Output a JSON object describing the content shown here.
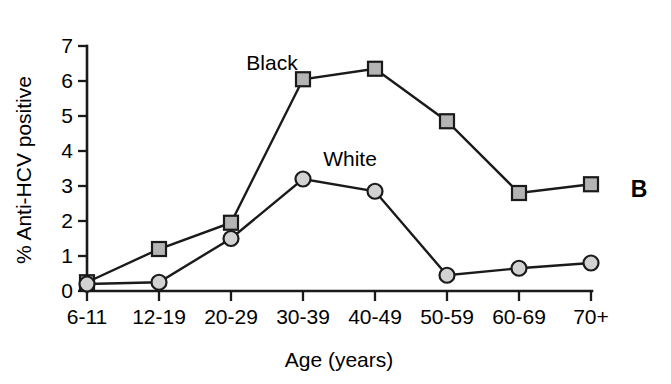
{
  "panel": {
    "label": "B"
  },
  "chart_data": {
    "type": "line",
    "title": "",
    "subtitle": "",
    "xlabel": "Age (years)",
    "ylabel": "% Anti-HCV positive",
    "categories": [
      "6-11",
      "12-19",
      "20-29",
      "30-39",
      "40-49",
      "50-59",
      "60-69",
      "70+"
    ],
    "series": [
      {
        "name": "Black",
        "marker": "square",
        "marker_fill": "#b4b4b4",
        "marker_edge": "#1a1a1a",
        "line_color": "#1a1a1a",
        "label_text": "Black",
        "values": [
          0.25,
          1.2,
          1.95,
          6.05,
          6.35,
          4.85,
          2.8,
          3.05
        ]
      },
      {
        "name": "White",
        "marker": "circle",
        "marker_fill": "#d2d2d2",
        "marker_edge": "#1a1a1a",
        "line_color": "#1a1a1a",
        "label_text": "White",
        "values": [
          0.2,
          0.25,
          1.5,
          3.2,
          2.85,
          0.45,
          0.65,
          0.8
        ]
      }
    ],
    "ylim": [
      0,
      7
    ],
    "yticks": [
      0,
      1,
      2,
      3,
      4,
      5,
      6,
      7
    ],
    "ytick_labels": [
      "0",
      "1",
      "2",
      "3",
      "4",
      "5",
      "6",
      "7"
    ],
    "grid": false,
    "legend": "inline-annotations"
  }
}
